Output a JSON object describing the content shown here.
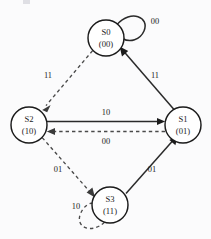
{
  "diagram": {
    "kind": "state-transition-diagram",
    "title": "",
    "width": 211,
    "height": 239,
    "colors": {
      "background": "#fdfdfd",
      "node_stroke": "#1b1b1b",
      "node_fill": "#ffffff",
      "solid_edge": "#2a2a2a",
      "dashed_edge": "#4a4a4a",
      "text": "#1b1b1b"
    },
    "nodes": [
      {
        "id": "S0",
        "name": "S0",
        "code": "(00)",
        "cx": 106,
        "cy": 38,
        "r": 18
      },
      {
        "id": "S2",
        "name": "S2",
        "code": "(10)",
        "cx": 29,
        "cy": 125,
        "r": 18
      },
      {
        "id": "S1",
        "name": "S1",
        "code": "(01)",
        "cx": 183,
        "cy": 125,
        "r": 18
      },
      {
        "id": "S3",
        "name": "S3",
        "code": "(11)",
        "cx": 110,
        "cy": 205,
        "r": 18
      }
    ],
    "edges": [
      {
        "id": "e-s0-s0",
        "from": "S0",
        "to": "S0",
        "label": "00",
        "style": "solid",
        "kind": "self-loop",
        "label_x": 155,
        "label_y": 22
      },
      {
        "id": "e-s1-s0",
        "from": "S1",
        "to": "S0",
        "label": "11",
        "style": "solid",
        "kind": "line",
        "label_x": 155,
        "label_y": 76
      },
      {
        "id": "e-s0-s2",
        "from": "S0",
        "to": "S2",
        "label": "11",
        "style": "dashed",
        "kind": "line",
        "label_x": 48,
        "label_y": 76
      },
      {
        "id": "e-s2-s1",
        "from": "S2",
        "to": "S1",
        "label": "10",
        "style": "solid",
        "kind": "line",
        "label_x": 106,
        "label_y": 113
      },
      {
        "id": "e-s1-s2",
        "from": "S1",
        "to": "S2",
        "label": "00",
        "style": "dashed",
        "kind": "line",
        "label_x": 106,
        "label_y": 142
      },
      {
        "id": "e-s2-s3",
        "from": "S2",
        "to": "S3",
        "label": "01",
        "style": "dashed",
        "kind": "line",
        "label_x": 58,
        "label_y": 170
      },
      {
        "id": "e-s3-s1",
        "from": "S3",
        "to": "S1",
        "label": "01",
        "style": "solid",
        "kind": "line",
        "label_x": 152,
        "label_y": 170
      },
      {
        "id": "e-s3-s3",
        "from": "S3",
        "to": "S3",
        "label": "10",
        "style": "dashed",
        "kind": "self-loop",
        "label_x": 76,
        "label_y": 207
      }
    ]
  }
}
